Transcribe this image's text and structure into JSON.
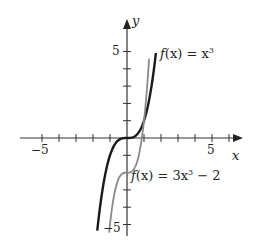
{
  "chart_data": {
    "type": "line",
    "title": "",
    "xlabel": "x",
    "ylabel": "y",
    "xlim": [
      -5.5,
      6
    ],
    "ylim": [
      -5.5,
      6.5
    ],
    "x_tick_labels": [
      "-5",
      "5"
    ],
    "y_tick_labels": [
      "5",
      "-5"
    ],
    "grid": false,
    "series": [
      {
        "name": "f(x) = x^3",
        "label": "f(x) = x³",
        "color": "#1a1a1a",
        "x": [
          -1.75,
          -1.5,
          -1,
          -0.5,
          0,
          0.5,
          1,
          1.5,
          1.7
        ],
        "y": [
          -5.36,
          -3.38,
          -1,
          -0.125,
          0,
          0.125,
          1,
          3.38,
          4.91
        ]
      },
      {
        "name": "f(x) = 3x^3 - 2",
        "label": "f(x) = 3x³ − 2",
        "color": "#8a8a8a",
        "x": [
          -1.05,
          -0.9,
          -0.6,
          -0.3,
          0,
          0.3,
          0.6,
          0.9,
          1.0,
          1.3
        ],
        "y": [
          -5.47,
          -4.19,
          -2.65,
          -2.08,
          -2,
          -1.92,
          -1.35,
          0.19,
          1,
          4.59
        ]
      }
    ]
  },
  "labels": {
    "y_axis": "y",
    "x_axis": "x",
    "y_tick_top": "5",
    "y_tick_bottom": "−5",
    "x_tick_left": "−5",
    "x_tick_right": "5",
    "curve1_prefix": "f",
    "curve1_mid": "(x) = x",
    "curve1_exp": "3",
    "curve2_prefix": "f",
    "curve2_mid": "(x) = 3x",
    "curve2_exp": "3",
    "curve2_suffix": " − 2"
  }
}
